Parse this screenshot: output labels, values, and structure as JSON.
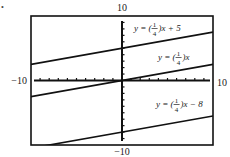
{
  "chart_data": {
    "type": "line",
    "title": "",
    "xlabel": "",
    "ylabel": "",
    "xlim": [
      -10,
      10
    ],
    "ylim": [
      -10,
      10
    ],
    "x_tick_step": 1,
    "y_tick_step": 1,
    "grid": false,
    "tick_labels": {
      "x_min": "−10",
      "x_max": "10",
      "y_min": "−10",
      "y_max": "10"
    },
    "series": [
      {
        "name": "y = (1/4)x + 5",
        "slope": 0.25,
        "intercept": 5,
        "x": [
          -10,
          10
        ],
        "y": [
          2.5,
          7.5
        ],
        "label_prefix": "y = (",
        "label_suffix": ")x + 5"
      },
      {
        "name": "y = (1/4)x",
        "slope": 0.25,
        "intercept": 0,
        "x": [
          -10,
          10
        ],
        "y": [
          -2.5,
          2.5
        ],
        "label_prefix": "y = (",
        "label_suffix": ")x"
      },
      {
        "name": "y = (1/4)x − 8",
        "slope": 0.25,
        "intercept": -8,
        "x": [
          -10,
          10
        ],
        "y": [
          -10.5,
          -5.5
        ],
        "label_prefix": "y = (",
        "label_suffix": ")x − 8"
      }
    ],
    "fraction": {
      "num": "1",
      "den": "4"
    },
    "line_color": "#111111"
  },
  "marker": "•"
}
